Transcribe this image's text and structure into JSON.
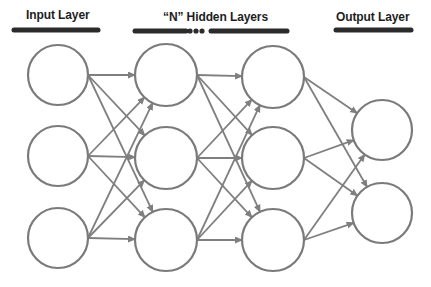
{
  "headings": {
    "input": "Input Layer",
    "hidden": "“N” Hidden Layers",
    "output": "Output Layer"
  },
  "colors": {
    "node_stroke": "#7a7a7a",
    "edge_stroke": "#7f7f7f",
    "heading_text": "#1e1e1e",
    "underline": "#2b2b2b",
    "background": "#ffffff"
  },
  "network": {
    "layers": [
      {
        "name": "input",
        "x": 58,
        "nodes": [
          75,
          156,
          238
        ],
        "r": 30
      },
      {
        "name": "hidden-1",
        "x": 166,
        "nodes": [
          75,
          158,
          240
        ],
        "r": 31
      },
      {
        "name": "hidden-2",
        "x": 273,
        "nodes": [
          77,
          158,
          240
        ],
        "r": 31
      },
      {
        "name": "output",
        "x": 382,
        "nodes": [
          130,
          213
        ],
        "r": 30
      }
    ],
    "connectivity": "fully-connected with arrowheads"
  },
  "underlines": {
    "input": [
      14,
      98,
      30
    ],
    "hidden_left": [
      135,
      186,
      31
    ],
    "hidden_dots": [
      190,
      196,
      202
    ],
    "hidden_right": [
      211,
      287,
      31
    ],
    "output": [
      336,
      411,
      30
    ]
  }
}
